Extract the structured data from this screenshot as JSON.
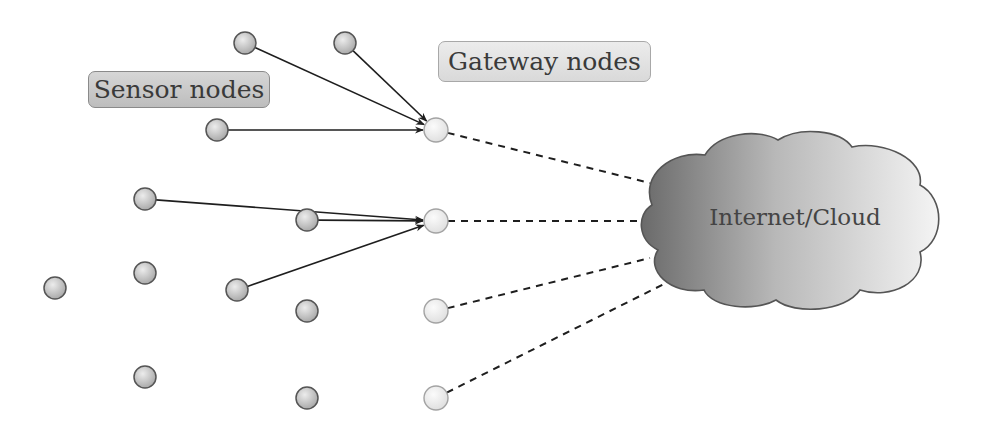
{
  "diagram": {
    "type": "network-topology",
    "labels": {
      "sensor": "Sensor nodes",
      "gateway": "Gateway nodes",
      "cloud": "Internet/Cloud"
    },
    "colors": {
      "sensor_fill_light": "#e4e4e4",
      "sensor_fill_dark": "#a9a9a9",
      "sensor_stroke": "#555555",
      "gateway_fill": "#f1f1f1",
      "gateway_stroke": "#a3a3a3",
      "cloud_dark": "#6e6e6e",
      "cloud_light": "#f2f2f2",
      "cloud_stroke": "#555555",
      "edge": "#1e1e1e"
    },
    "sensor_nodes": [
      {
        "id": "s1",
        "x": 245,
        "y": 43
      },
      {
        "id": "s2",
        "x": 345,
        "y": 43
      },
      {
        "id": "s3",
        "x": 217,
        "y": 130
      },
      {
        "id": "s4",
        "x": 145,
        "y": 199
      },
      {
        "id": "s5",
        "x": 307,
        "y": 220
      },
      {
        "id": "s6",
        "x": 145,
        "y": 273
      },
      {
        "id": "s7",
        "x": 55,
        "y": 288
      },
      {
        "id": "s8",
        "x": 237,
        "y": 290
      },
      {
        "id": "s9",
        "x": 307,
        "y": 311
      },
      {
        "id": "s10",
        "x": 145,
        "y": 377
      },
      {
        "id": "s11",
        "x": 307,
        "y": 398
      }
    ],
    "gateway_nodes": [
      {
        "id": "g1",
        "x": 436,
        "y": 130
      },
      {
        "id": "g2",
        "x": 436,
        "y": 221
      },
      {
        "id": "g3",
        "x": 436,
        "y": 311
      },
      {
        "id": "g4",
        "x": 436,
        "y": 398
      }
    ],
    "sensor_to_gateway_edges": [
      {
        "from": "s1",
        "to": "g1",
        "style": "solid-arrow"
      },
      {
        "from": "s2",
        "to": "g1",
        "style": "solid-arrow"
      },
      {
        "from": "s3",
        "to": "g1",
        "style": "solid-arrow"
      },
      {
        "from": "s4",
        "to": "g2",
        "style": "solid-arrow"
      },
      {
        "from": "s5",
        "to": "g2",
        "style": "solid-arrow"
      },
      {
        "from": "s8",
        "to": "g2",
        "style": "solid-arrow"
      }
    ],
    "gateway_to_cloud_edges": [
      {
        "from": "g1",
        "to_x": 650,
        "to_y": 183,
        "style": "dashed"
      },
      {
        "from": "g2",
        "to_x": 642,
        "to_y": 221,
        "style": "dashed"
      },
      {
        "from": "g3",
        "to_x": 650,
        "to_y": 258,
        "style": "dashed"
      },
      {
        "from": "g4",
        "to_x": 682,
        "to_y": 275,
        "style": "dashed"
      }
    ]
  }
}
